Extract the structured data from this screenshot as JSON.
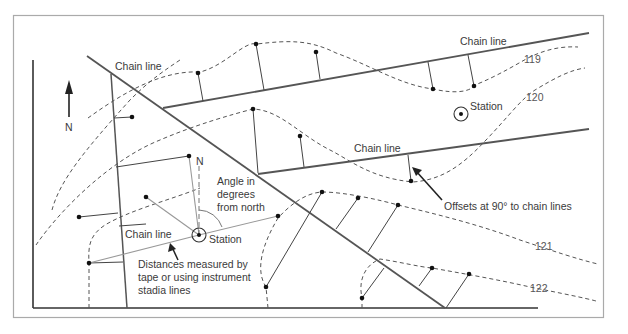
{
  "diagram": {
    "type": "survey-plan",
    "labels": {
      "north_arrow": "N",
      "chain_line_top_left": "Chain line",
      "chain_line_top_right": "Chain line",
      "chain_line_middle": "Chain line",
      "chain_line_lower_left": "Chain line",
      "station_right": "Station",
      "station_center": "Station",
      "station_north": "N",
      "angle_note_line1": "Angle in",
      "angle_note_line2": "degrees",
      "angle_note_line3": "from north",
      "distance_note_line1": "Distances measured by",
      "distance_note_line2": "tape or using instrument",
      "distance_note_line3": "stadia lines",
      "offsets_note": "Offsets at 90° to chain lines"
    },
    "contours": [
      {
        "elevation": "119"
      },
      {
        "elevation": "120"
      },
      {
        "elevation": "121"
      },
      {
        "elevation": "122"
      }
    ],
    "colors": {
      "chain_line": "#555555",
      "offset_line": "#444444",
      "contour": "#555555",
      "radial_line": "#999999",
      "frame": "#aaaaaa",
      "text": "#3a3a3a"
    }
  }
}
